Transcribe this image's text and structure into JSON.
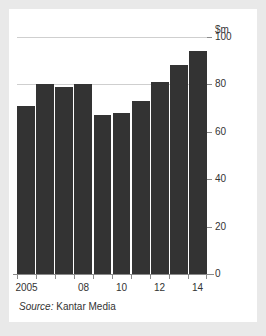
{
  "chart_data": {
    "type": "bar",
    "title": "",
    "subtitle": "",
    "xlabel": "",
    "ylabel": "$m",
    "unit_label": "$m",
    "categories": [
      "2005",
      "06",
      "07",
      "08",
      "09",
      "10",
      "11",
      "12",
      "13",
      "14"
    ],
    "values": [
      71,
      80,
      79,
      80,
      67,
      68,
      73,
      81,
      88,
      94
    ],
    "ylim": [
      0,
      100
    ],
    "yticks": [
      0,
      20,
      40,
      60,
      80,
      100
    ],
    "ytick_labels": [
      "0",
      "20",
      "40",
      "60",
      "80",
      "100"
    ],
    "xtick_labels_shown": [
      "2005",
      "08",
      "10",
      "12",
      "14"
    ],
    "xtick_label_categories": [
      0,
      3,
      5,
      7,
      9
    ],
    "gridlines": [
      80,
      100
    ],
    "grid": true,
    "legend": "none",
    "bar_color": "#333333",
    "gridline_color": "#cfcfcf",
    "axis_color": "#8a8a8a"
  },
  "source": {
    "prefix": "Source:",
    "name": "Kantar Media"
  },
  "colors": {
    "page_background": "#e9e9e9",
    "card_background": "#ffffff",
    "text": "#333333"
  }
}
